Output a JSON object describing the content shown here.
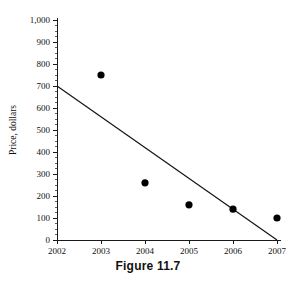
{
  "figure": {
    "caption": "Figure 11.7"
  },
  "chart_data": {
    "type": "scatter",
    "title": "",
    "xlabel": "",
    "ylabel": "Price, dollars",
    "x": [
      2003,
      2004,
      2005,
      2006,
      2007
    ],
    "values": [
      750,
      260,
      160,
      140,
      100
    ],
    "points": [
      {
        "x": 2003,
        "y": 750
      },
      {
        "x": 2004,
        "y": 260
      },
      {
        "x": 2005,
        "y": 160
      },
      {
        "x": 2006,
        "y": 140
      },
      {
        "x": 2007,
        "y": 100
      }
    ],
    "series": [
      {
        "name": "Price",
        "values": [
          750,
          260,
          160,
          140,
          100
        ]
      }
    ],
    "trend_line": {
      "type": "line",
      "x": [
        2002,
        2007
      ],
      "values": [
        700,
        0
      ],
      "start": {
        "x": 2002,
        "y": 700
      },
      "end": {
        "x": 2007,
        "y": 0
      }
    },
    "xlim": [
      2002,
      2007
    ],
    "ylim": [
      0,
      1000
    ],
    "xticks": [
      2002,
      2003,
      2004,
      2005,
      2006,
      2007
    ],
    "xtick_labels": [
      "2002",
      "2003",
      "2004",
      "2005",
      "2006",
      "2007"
    ],
    "yticks": [
      0,
      100,
      200,
      300,
      400,
      500,
      600,
      700,
      800,
      900,
      1000
    ],
    "ytick_labels": [
      "0",
      "100",
      "200",
      "300",
      "400",
      "500",
      "600",
      "700",
      "800",
      "900",
      "1,000"
    ],
    "grid": false,
    "legend": null,
    "minor_ticks": true,
    "marker_color": "#000000",
    "line_color": "#111111",
    "axis_color": "#1a1a1a"
  }
}
